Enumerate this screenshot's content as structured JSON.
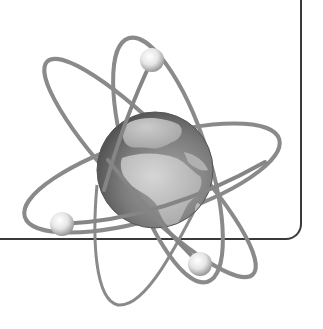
{
  "illustration": {
    "subject": "atom-with-globe-nucleus",
    "palette": {
      "background": "#ffffff",
      "frame": "#3a3a3a",
      "orbit": "#8a8a8a",
      "globe_ocean_dark": "#5e5e5e",
      "globe_ocean_light": "#9a9a9a",
      "globe_land": "#c4c4c4",
      "electron_light": "#ffffff",
      "electron_dark": "#8c8c8c"
    },
    "nucleus": {
      "type": "globe",
      "view": "Europe-Africa"
    },
    "orbits": [
      {
        "name": "orbit-wide",
        "cx": 152,
        "cy": 178,
        "rx": 133,
        "ry": 40,
        "rotate": -17
      },
      {
        "name": "orbit-tall-right",
        "cx": 162,
        "cy": 170,
        "rx": 142,
        "ry": 36,
        "rotate": 72
      },
      {
        "name": "orbit-diagonal",
        "cx": 150,
        "cy": 168,
        "rx": 148,
        "ry": 34,
        "rotate": 46
      }
    ],
    "electrons": [
      {
        "name": "electron-top",
        "x": 152,
        "y": 60,
        "r": 12
      },
      {
        "name": "electron-left",
        "x": 62,
        "y": 224,
        "r": 12
      },
      {
        "name": "electron-bottom",
        "x": 200,
        "y": 264,
        "r": 12
      }
    ]
  }
}
